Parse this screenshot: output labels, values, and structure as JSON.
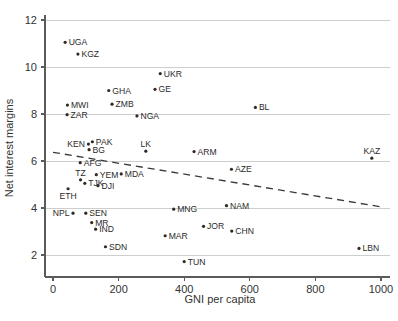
{
  "figure": {
    "width": 398,
    "height": 321,
    "background": "#ffffff",
    "marker_color": "#2b2b2b",
    "gridline_color": "#c9c9c9",
    "axis_color": "#5b5b5b",
    "trendline_color": "#3a3a3a"
  },
  "chart_data": {
    "type": "scatter",
    "title": "",
    "subtitle": "",
    "xlabel": "GNI per capita",
    "ylabel": "Net interest margins",
    "xlim": [
      0,
      1000
    ],
    "ylim": [
      1.4,
      12.3
    ],
    "xticks": [
      0,
      200,
      400,
      600,
      800,
      1000
    ],
    "xtick_labels": [
      "0",
      "200",
      "400",
      "600",
      "800",
      "1000"
    ],
    "yticks": [
      2,
      4,
      6,
      8,
      10,
      12
    ],
    "ytick_labels": [
      "2",
      "4",
      "6",
      "8",
      "10",
      "12"
    ],
    "grid": "horizontal",
    "legend": "none",
    "point_label_field": "label",
    "points": [
      {
        "label": "UGA",
        "x": 37,
        "y": 11.05,
        "label_pos": "right"
      },
      {
        "label": "KGZ",
        "x": 76,
        "y": 10.55,
        "label_pos": "right"
      },
      {
        "label": "UKR",
        "x": 327,
        "y": 9.72,
        "label_pos": "right"
      },
      {
        "label": "GE",
        "x": 311,
        "y": 9.05,
        "label_pos": "right"
      },
      {
        "label": "GHA",
        "x": 170,
        "y": 9.0,
        "label_pos": "right"
      },
      {
        "label": "ZMB",
        "x": 180,
        "y": 8.42,
        "label_pos": "right"
      },
      {
        "label": "MWI",
        "x": 44,
        "y": 8.38,
        "label_pos": "right"
      },
      {
        "label": "BL",
        "x": 617,
        "y": 8.28,
        "label_pos": "right"
      },
      {
        "label": "ZAR",
        "x": 43,
        "y": 7.97,
        "label_pos": "right"
      },
      {
        "label": "NGA",
        "x": 256,
        "y": 7.92,
        "label_pos": "right"
      },
      {
        "label": "PAK",
        "x": 120,
        "y": 6.82,
        "label_pos": "right"
      },
      {
        "label": "KEN",
        "x": 108,
        "y": 6.72,
        "label_pos": "left"
      },
      {
        "label": "BG",
        "x": 110,
        "y": 6.48,
        "label_pos": "right"
      },
      {
        "label": "ARM",
        "x": 430,
        "y": 6.4,
        "label_pos": "right"
      },
      {
        "label": "LK",
        "x": 283,
        "y": 6.42,
        "label_pos": "above"
      },
      {
        "label": "KAZ",
        "x": 972,
        "y": 6.12,
        "label_pos": "above"
      },
      {
        "label": "AFG",
        "x": 83,
        "y": 5.93,
        "label_pos": "right"
      },
      {
        "label": "AZE",
        "x": 544,
        "y": 5.65,
        "label_pos": "right"
      },
      {
        "label": "YEM",
        "x": 132,
        "y": 5.42,
        "label_pos": "right"
      },
      {
        "label": "MDA",
        "x": 208,
        "y": 5.45,
        "label_pos": "right"
      },
      {
        "label": "TZ",
        "x": 84,
        "y": 5.2,
        "label_pos": "above"
      },
      {
        "label": "TJK",
        "x": 97,
        "y": 5.05,
        "label_pos": "right"
      },
      {
        "label": "DJI",
        "x": 137,
        "y": 4.95,
        "label_pos": "right"
      },
      {
        "label": "ETH",
        "x": 46,
        "y": 4.82,
        "label_pos": "below"
      },
      {
        "label": "NAM",
        "x": 529,
        "y": 4.1,
        "label_pos": "right"
      },
      {
        "label": "MNG",
        "x": 368,
        "y": 3.95,
        "label_pos": "right"
      },
      {
        "label": "NPL",
        "x": 61,
        "y": 3.78,
        "label_pos": "left"
      },
      {
        "label": "SEN",
        "x": 100,
        "y": 3.78,
        "label_pos": "right"
      },
      {
        "label": "MR",
        "x": 118,
        "y": 3.38,
        "label_pos": "right"
      },
      {
        "label": "JOR",
        "x": 459,
        "y": 3.22,
        "label_pos": "right"
      },
      {
        "label": "IND",
        "x": 130,
        "y": 3.1,
        "label_pos": "right"
      },
      {
        "label": "CHN",
        "x": 545,
        "y": 3.02,
        "label_pos": "right"
      },
      {
        "label": "MAR",
        "x": 342,
        "y": 2.82,
        "label_pos": "right"
      },
      {
        "label": "SDN",
        "x": 160,
        "y": 2.35,
        "label_pos": "right"
      },
      {
        "label": "LBN",
        "x": 933,
        "y": 2.28,
        "label_pos": "right"
      },
      {
        "label": "TUN",
        "x": 400,
        "y": 1.72,
        "label_pos": "right"
      }
    ],
    "trendline": {
      "type": "linear-fit",
      "style": "dashed",
      "x_start": 0,
      "y_start": 6.37,
      "x_end": 1000,
      "y_end": 4.05
    }
  },
  "caption": {
    "cropped_text": ""
  }
}
